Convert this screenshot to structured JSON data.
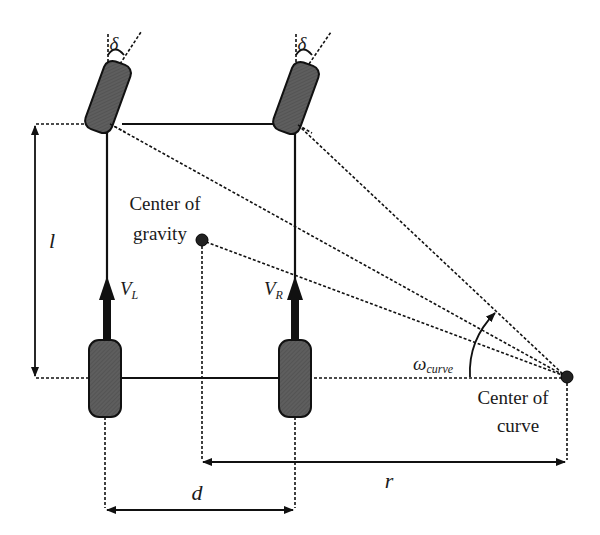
{
  "diagram": {
    "labels": {
      "delta_left": "δ",
      "delta_right": "δ",
      "wheelbase": "l",
      "track": "d",
      "radius": "r",
      "v_left": "V",
      "v_left_sub": "L",
      "v_right": "V",
      "v_right_sub": "R",
      "omega": "ω",
      "omega_sub": "curve",
      "cog_line1": "Center of",
      "cog_line2": "gravity",
      "coc_line1": "Center of",
      "coc_line2": "curve"
    },
    "colors": {
      "wheel_fill": "#5a5a5a",
      "line": "#111111",
      "background": "#ffffff"
    }
  }
}
